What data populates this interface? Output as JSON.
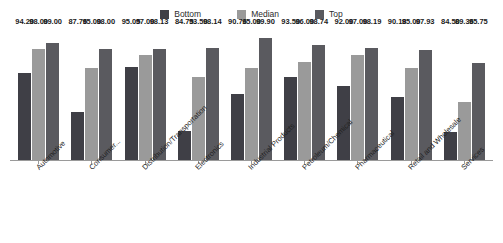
{
  "legend": {
    "position": "top-center",
    "entries": [
      {
        "label": "Bottom",
        "color": "#3f3f46"
      },
      {
        "label": "Median",
        "color": "#9a9a9a"
      },
      {
        "label": "Top",
        "color": "#5a5a5f"
      }
    ]
  },
  "chart_data": {
    "type": "bar",
    "title": "",
    "subtitle": "",
    "xlabel": "",
    "ylabel": "",
    "grid": false,
    "legend_position": "top-center",
    "ylim": [
      80,
      100
    ],
    "categories": [
      "Automotive",
      "Consumer...",
      "Distribution/Transportation",
      "Electronics",
      "Industrial Products",
      "Petroleum/Chemical",
      "Pharmaceutical",
      "Retail and Wholesale",
      "Services"
    ],
    "series": [
      {
        "name": "Bottom",
        "color": "#3f3f46",
        "values": [
          94.2,
          87.76,
          95.05,
          84.75,
          90.76,
          93.5,
          92.0,
          90.18,
          84.5
        ],
        "labels": [
          "94.20",
          "87.76",
          "95.05",
          "84.75",
          "90.76",
          "93.50",
          "92.00",
          "90.18",
          "84.50"
        ]
      },
      {
        "name": "Median",
        "color": "#9a9a9a",
        "values": [
          98.0,
          95.0,
          97.0,
          93.5,
          95.0,
          96.0,
          97.0,
          95.0,
          89.36
        ],
        "labels": [
          "98.00",
          "95.00",
          "97.00",
          "93.50",
          "95.00",
          "96.00",
          "97.00",
          "95.00",
          "89.36"
        ]
      },
      {
        "name": "Top",
        "color": "#5a5a5f",
        "values": [
          99.0,
          98.0,
          98.13,
          98.14,
          99.9,
          98.74,
          98.19,
          97.93,
          95.75
        ],
        "labels": [
          "99.00",
          "98.00",
          "98.13",
          "98.14",
          "99.90",
          "98.74",
          "98.19",
          "97.93",
          "95.75"
        ]
      }
    ]
  }
}
